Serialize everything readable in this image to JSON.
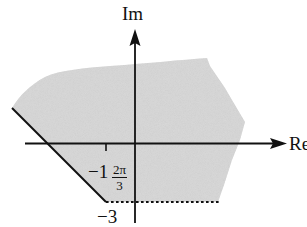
{
  "diagram": {
    "colors": {
      "region_fill": "#d6d6d6",
      "axis": "#111111",
      "boundary": "#111111"
    },
    "axes": {
      "x_label": "Re",
      "y_label": "Im"
    },
    "labels": {
      "real_tick": "−1",
      "imag_tick": "−3",
      "angle_numerator": "2π",
      "angle_denominator": "3"
    },
    "region": {
      "description": "Shaded region bounded below by a dashed horizontal line at Im = −3 (excluded) and on the left by a solid ray at angle 2π/3 (included), unbounded elsewhere",
      "bottom_boundary": {
        "style": "dotted",
        "value": "Im = −3",
        "included": false
      },
      "left_boundary": {
        "style": "solid",
        "angle": "2π/3",
        "included": true
      }
    }
  }
}
